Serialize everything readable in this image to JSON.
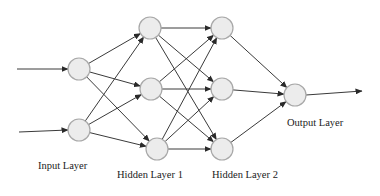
{
  "diagram": {
    "type": "feedforward-neural-network",
    "colors": {
      "node_fill": "#ececec",
      "node_stroke": "#a8a8a8",
      "edge": "#3a3a3a",
      "label": "#222222",
      "background": "#ffffff"
    },
    "layers": [
      {
        "id": "input",
        "label": "Input Layer",
        "nodes": [
          {
            "x": 79,
            "y": 69
          },
          {
            "x": 79,
            "y": 130
          }
        ],
        "label_pos": {
          "x": 38,
          "y": 168
        }
      },
      {
        "id": "hidden1",
        "label": "Hidden Layer 1",
        "nodes": [
          {
            "x": 150,
            "y": 28
          },
          {
            "x": 151,
            "y": 89
          },
          {
            "x": 157,
            "y": 149
          }
        ],
        "label_pos": {
          "x": 117,
          "y": 176
        }
      },
      {
        "id": "hidden2",
        "label": "Hidden Layer 2",
        "nodes": [
          {
            "x": 222,
            "y": 28
          },
          {
            "x": 222,
            "y": 89
          },
          {
            "x": 222,
            "y": 149
          }
        ],
        "label_pos": {
          "x": 212,
          "y": 176
        }
      },
      {
        "id": "output",
        "label": "Output Layer",
        "nodes": [
          {
            "x": 295,
            "y": 95
          }
        ],
        "label_pos": {
          "x": 287,
          "y": 125
        }
      }
    ],
    "node_radius": 11,
    "input_arrows": [
      {
        "from": {
          "x": 17,
          "y": 69
        }
      },
      {
        "from": {
          "x": 19,
          "y": 132
        }
      }
    ],
    "output_arrow": {
      "to": {
        "x": 362,
        "y": 91
      }
    },
    "connections": "fully-connected between adjacent layers"
  }
}
